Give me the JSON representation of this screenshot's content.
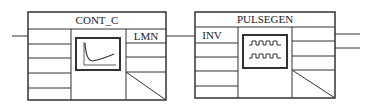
{
  "diagram": {
    "blocks": [
      {
        "id": "cont_c",
        "title": "CONT_C",
        "icon": "step-response-curve-icon",
        "inputs": [
          ""
        ],
        "outputs": [
          "LMN"
        ]
      },
      {
        "id": "pulsegen",
        "title": "PULSEGEN",
        "icon": "pulse-train-icon",
        "inputs": [
          "INV"
        ],
        "outputs": [
          "",
          ""
        ]
      }
    ],
    "connections": [
      {
        "from": "external-input",
        "to": "cont_c"
      },
      {
        "from": "cont_c.LMN",
        "to": "pulsegen.INV"
      },
      {
        "from": "pulsegen",
        "to": "external-output-1"
      },
      {
        "from": "pulsegen",
        "to": "external-output-2"
      }
    ],
    "colors": {
      "line": "#333333",
      "background": "#ffffff"
    }
  }
}
